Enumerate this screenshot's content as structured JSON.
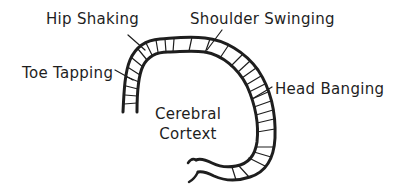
{
  "diagram": {
    "labels": {
      "hip_shaking": "Hip Shaking",
      "shoulder_swinging": "Shoulder Swinging",
      "toe_tapping": "Toe Tapping",
      "head_banging": "Head Banging",
      "center_line1": "Cerebral",
      "center_line2": "Cortext"
    },
    "colors": {
      "stroke": "#1e1e1e",
      "background": "#ffffff"
    }
  }
}
